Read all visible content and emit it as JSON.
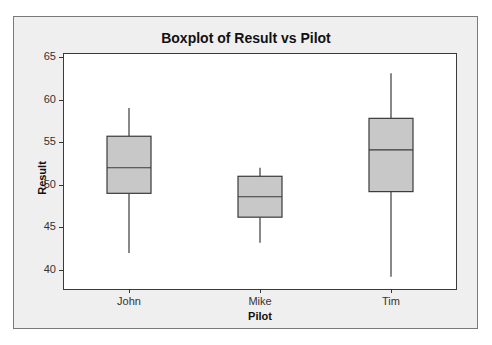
{
  "chart_data": {
    "type": "boxplot",
    "title": "Boxplot of Result vs Pilot",
    "xlabel": "Pilot",
    "ylabel": "Result",
    "categories": [
      "John",
      "Mike",
      "Tim"
    ],
    "ylim": [
      38,
      65.5
    ],
    "yticks": [
      40,
      45,
      50,
      55,
      60,
      65
    ],
    "grid": false,
    "legend": null,
    "series": [
      {
        "name": "John",
        "whisker_low": 42,
        "q1": 49,
        "median": 52,
        "q3": 55.7,
        "whisker_high": 59
      },
      {
        "name": "Mike",
        "whisker_low": 43.2,
        "q1": 46.2,
        "median": 48.6,
        "q3": 51,
        "whisker_high": 52
      },
      {
        "name": "Tim",
        "whisker_low": 39.2,
        "q1": 49.2,
        "median": 54.1,
        "q3": 57.8,
        "whisker_high": 63.1
      }
    ],
    "colors": {
      "box_fill": "#c8c8c8",
      "box_stroke": "#3a3a3a",
      "frame_bg": "#efefef",
      "plot_bg": "#ffffff"
    }
  }
}
